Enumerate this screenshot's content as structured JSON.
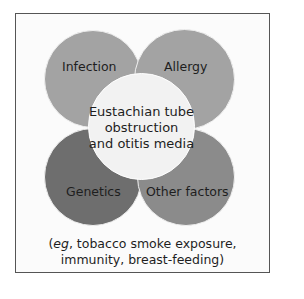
{
  "diagram": {
    "center": {
      "line1": "Eustachian tube",
      "line2": "obstruction",
      "line3": "and otitis media"
    },
    "factors": [
      {
        "label": "Infection",
        "color": "#a3a3a3"
      },
      {
        "label": "Allergy",
        "color": "#a3a3a3"
      },
      {
        "label": "Genetics",
        "color": "#6e6e6e"
      },
      {
        "label": "Other factors",
        "color": "#8b8b8b"
      }
    ],
    "center_color": "#f2f2f2",
    "caption": {
      "eg": "eg",
      "line1_rest": ", tobacco smoke exposure,",
      "line2": "immunity, breast-feeding)"
    }
  }
}
